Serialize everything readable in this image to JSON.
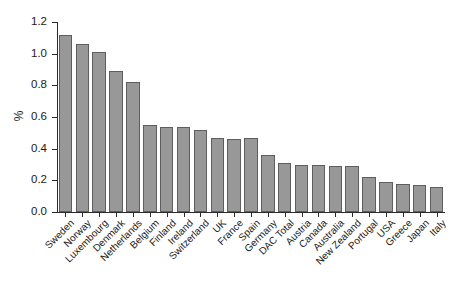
{
  "chart_data": {
    "type": "bar",
    "title": "",
    "xlabel": "",
    "ylabel": "%",
    "ylim": [
      0,
      1.2
    ],
    "yticks": [
      0.0,
      0.2,
      0.4,
      0.6,
      0.8,
      1.0,
      1.2
    ],
    "ytick_labels": [
      "0.0",
      "0.2",
      "0.4",
      "0.6",
      "0.8",
      "1.0",
      "1.2"
    ],
    "grid": false,
    "legend": null,
    "bar_color": "#989898",
    "bar_edge_color": "#5e5e5e",
    "axis_color": "#2b2b2b",
    "categories": [
      "Sweden",
      "Norway",
      "Luxembourg",
      "Denmark",
      "Netherlands",
      "Belgium",
      "Finland",
      "Ireland",
      "Switzerland",
      "UK",
      "France",
      "Spain",
      "Germany",
      "DAC Total",
      "Austria",
      "Canada",
      "Australia",
      "New Zealand",
      "Portugal",
      "USA",
      "Greece",
      "Japan",
      "Italy"
    ],
    "values": [
      1.12,
      1.06,
      1.01,
      0.89,
      0.82,
      0.55,
      0.54,
      0.54,
      0.52,
      0.47,
      0.46,
      0.47,
      0.36,
      0.31,
      0.3,
      0.3,
      0.29,
      0.29,
      0.22,
      0.19,
      0.18,
      0.17,
      0.16
    ]
  }
}
